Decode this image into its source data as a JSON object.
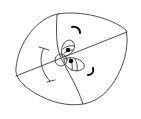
{
  "figure": {
    "type": "line-drawing",
    "colors": {
      "background": "#ffffff",
      "line": "#3a3a3a",
      "ink": "#111111"
    },
    "elements": [
      {
        "name": "egg-outline"
      },
      {
        "name": "dividing-line-curved"
      },
      {
        "name": "dividing-line-straight"
      },
      {
        "name": "center-circle"
      },
      {
        "name": "upper-eye"
      },
      {
        "name": "lower-eye"
      },
      {
        "name": "upper-crescent"
      },
      {
        "name": "lower-crescent"
      },
      {
        "name": "left-ibeam-arc"
      }
    ]
  }
}
